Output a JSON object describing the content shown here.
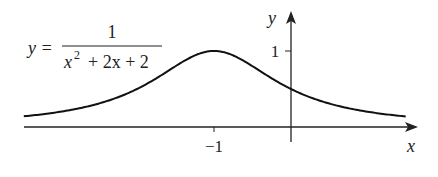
{
  "chart_data": {
    "type": "line",
    "title": "",
    "equation": {
      "lhs": "y =",
      "numerator": "1",
      "denominator_x": "x",
      "denominator_exp": "2",
      "denominator_rest": "+ 2x + 2"
    },
    "function": "1/(x^2+2x+2)",
    "xlabel": "x",
    "ylabel": "y",
    "x_ticks": [
      {
        "value": -1,
        "label": "−1"
      }
    ],
    "y_ticks": [
      {
        "value": 1,
        "label": "1"
      }
    ],
    "xlim": [
      -3.47,
      1.49
    ],
    "ylim": [
      0,
      1.0
    ],
    "grid": false,
    "legend": "none",
    "series": [
      {
        "name": "y = 1/(x^2+2x+2)",
        "x": [
          -3.47,
          -3.0,
          -2.5,
          -2.0,
          -1.5,
          -1.0,
          -0.5,
          0.0,
          0.5,
          1.0,
          1.49
        ],
        "y": [
          0.14,
          0.2,
          0.31,
          0.5,
          0.8,
          1.0,
          0.8,
          0.5,
          0.31,
          0.2,
          0.14
        ]
      }
    ],
    "annotations": [
      "maximum at (-1, 1)",
      "y-intercept at (0, 0.5)"
    ]
  },
  "colors": {
    "curve": "#111111",
    "axes": "#222222",
    "background": "#ffffff"
  }
}
